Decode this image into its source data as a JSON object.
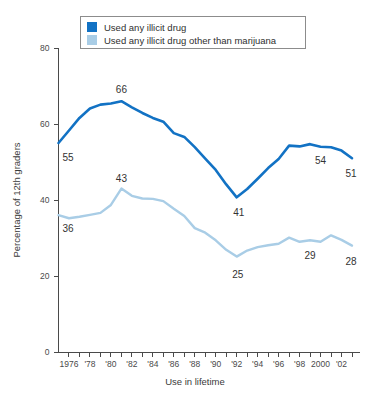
{
  "chart_data": {
    "type": "line",
    "title": "",
    "xlabel": "Use in lifetime",
    "ylabel": "Percentage of 12th graders",
    "ylim": [
      0,
      80
    ],
    "xlim": [
      1975,
      2003
    ],
    "yticks": [
      0,
      20,
      40,
      60,
      80
    ],
    "ytick_labels": [
      "0",
      "20",
      "40",
      "60",
      "80"
    ],
    "grid": false,
    "legend_position": "top",
    "x": [
      1975,
      1976,
      1977,
      1978,
      1979,
      1980,
      1981,
      1982,
      1983,
      1984,
      1985,
      1986,
      1987,
      1988,
      1989,
      1990,
      1991,
      1992,
      1993,
      1994,
      1995,
      1996,
      1997,
      1998,
      1999,
      2000,
      2001,
      2002,
      2003
    ],
    "xtick_labels": [
      {
        "x": 1976,
        "label": "1976"
      },
      {
        "x": 1978,
        "label": "'78"
      },
      {
        "x": 1980,
        "label": "'80"
      },
      {
        "x": 1982,
        "label": "'82"
      },
      {
        "x": 1984,
        "label": "'84"
      },
      {
        "x": 1986,
        "label": "'86"
      },
      {
        "x": 1988,
        "label": "'88"
      },
      {
        "x": 1990,
        "label": "'90"
      },
      {
        "x": 1992,
        "label": "'92"
      },
      {
        "x": 1994,
        "label": "'94"
      },
      {
        "x": 1996,
        "label": "'96"
      },
      {
        "x": 1998,
        "label": "'98"
      },
      {
        "x": 2000,
        "label": "2000"
      },
      {
        "x": 2002,
        "label": "'02"
      }
    ],
    "series": [
      {
        "name": "Used any illicit drug",
        "color": "#1272c4",
        "values": [
          55,
          58.3,
          61.6,
          64.1,
          65.1,
          65.4,
          66,
          64.4,
          62.9,
          61.6,
          60.6,
          57.6,
          56.6,
          53.9,
          50.9,
          47.9,
          44.1,
          40.7,
          42.9,
          45.6,
          48.4,
          50.8,
          54.3,
          54.1,
          54.7,
          54,
          53.9,
          53,
          51
        ],
        "labels": [
          {
            "x": 1975,
            "value": 55,
            "text": "55"
          },
          {
            "x": 1981,
            "value": 66,
            "text": "66"
          },
          {
            "x": 1992,
            "value": 41,
            "text": "41"
          },
          {
            "x": 2000,
            "value": 54,
            "text": "54"
          },
          {
            "x": 2003,
            "value": 51,
            "text": "51"
          }
        ]
      },
      {
        "name": "Used any illicit drug other than marijuana",
        "color": "#a9cde6",
        "values": [
          36,
          35.2,
          35.6,
          36.1,
          36.6,
          38.7,
          43,
          41.1,
          40.4,
          40.3,
          39.7,
          37.7,
          35.8,
          32.6,
          31.4,
          29.4,
          26.9,
          25.1,
          26.7,
          27.6,
          28.1,
          28.5,
          30.1,
          29,
          29.4,
          29,
          30.7,
          29.5,
          28
        ],
        "labels": [
          {
            "x": 1975,
            "value": 36,
            "text": "36"
          },
          {
            "x": 1981,
            "value": 43,
            "text": "43"
          },
          {
            "x": 1992,
            "value": 25,
            "text": "25"
          },
          {
            "x": 1999,
            "value": 29,
            "text": "29"
          },
          {
            "x": 2003,
            "value": 28,
            "text": "28"
          }
        ]
      }
    ]
  },
  "legend": {
    "items": [
      {
        "label": "Used any illicit drug",
        "color": "#1272c4"
      },
      {
        "label": "Used any illicit drug other than marijuana",
        "color": "#a9cde6"
      }
    ]
  }
}
